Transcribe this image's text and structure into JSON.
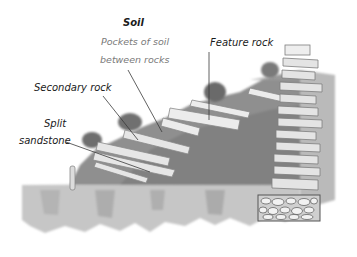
{
  "diagram": {
    "labels": {
      "soil_title": "Soil",
      "soil_desc_line1": "Pockets of soil",
      "soil_desc_line2": "between rocks",
      "feature_rock": "Feature rock",
      "secondary_rock": "Secondary rock",
      "split_line1": "Split",
      "split_line2": "sandstone"
    },
    "colors": {
      "background": "#ffffff",
      "soil_dark": "#7d7d7d",
      "soil_mid": "#9a9a9a",
      "ground_light": "#c9c9c9",
      "rock_light": "#e6e6e6",
      "rock_edge": "#8a8a8a",
      "leader_line": "#3a3a3a",
      "text": "#1a1a1a",
      "text_muted": "#7a7a7a"
    }
  }
}
